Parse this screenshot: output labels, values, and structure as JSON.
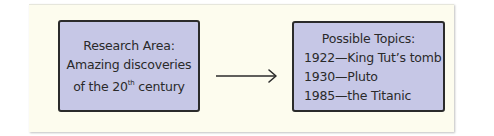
{
  "research_area": {
    "title": "Research Area:",
    "line1": "Amazing discoveries",
    "line2_prefix": "of the 20",
    "line2_sup": "th",
    "line2_suffix": " century"
  },
  "arrow": {
    "direction": "right"
  },
  "possible_topics": {
    "title": "Possible Topics:",
    "items": [
      "1922—King Tut’s tomb",
      "1930—Pluto",
      "1985—the Titanic"
    ]
  },
  "colors": {
    "card_background": "#fdfcee",
    "box_fill": "#c6c7e6",
    "box_border": "#2b2b2b",
    "text": "#2a2a2a"
  }
}
